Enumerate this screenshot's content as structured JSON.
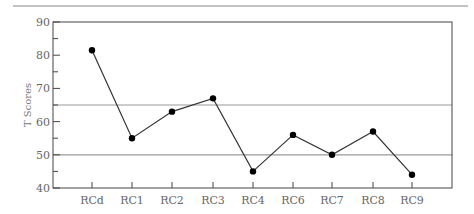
{
  "chart_data": {
    "type": "line",
    "title": "",
    "xlabel": "",
    "ylabel": "T Scores",
    "ylim": [
      40,
      90
    ],
    "yticks": [
      40,
      50,
      60,
      70,
      80,
      90
    ],
    "yminor_step": 5,
    "categories": [
      "RCd",
      "RC1",
      "RC2",
      "RC3",
      "RC4",
      "RC6",
      "RC7",
      "RC8",
      "RC9"
    ],
    "series": [
      {
        "name": "T Score",
        "values": [
          81.5,
          55,
          63,
          67,
          45,
          56,
          50,
          57,
          44
        ]
      }
    ],
    "reference_lines": [
      65,
      50
    ],
    "grid": false,
    "legend": null
  },
  "colors": {
    "line": "#333333",
    "marker": "#000000",
    "axis": "#444444",
    "reference_line": "#999999",
    "top_rule": "#888888",
    "tick_text": "#666666"
  }
}
